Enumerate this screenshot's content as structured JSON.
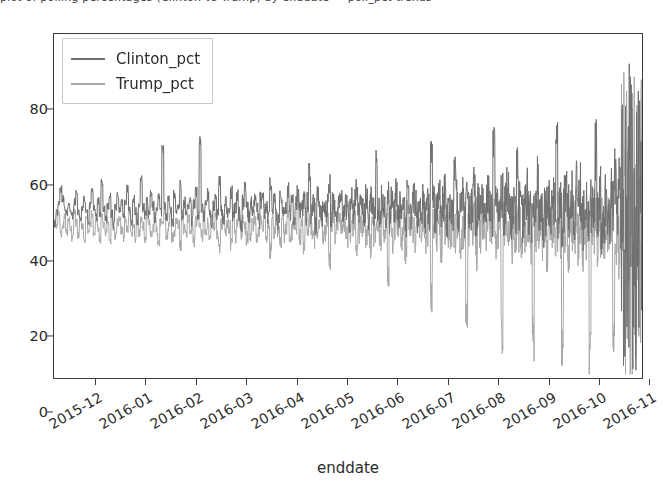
{
  "figure": {
    "top_text_fragment": "plot of polling percentages (Clinton vs Trump) by enddate — poll_pct trends",
    "background_color": "#ffffff"
  },
  "chart_data": {
    "type": "line",
    "title": "",
    "xlabel": "enddate",
    "ylabel": "",
    "ylim": [
      0,
      92
    ],
    "yticks": [
      0,
      20,
      40,
      60,
      80
    ],
    "ytick_labels": [
      "0",
      "20",
      "40",
      "60",
      "80"
    ],
    "grid": false,
    "legend_position": "upper left",
    "xticks": [
      0,
      1,
      2,
      3,
      4,
      5,
      6,
      7,
      8,
      9,
      10,
      11
    ],
    "xtick_labels": [
      "2015-12",
      "2016-01",
      "2016-02",
      "2016-03",
      "2016-04",
      "2016-05",
      "2016-06",
      "2016-07",
      "2016-08",
      "2016-09",
      "2016-10",
      "2016-11"
    ],
    "x_range": [
      "2015-11-20",
      "2016-11-08"
    ],
    "series": [
      {
        "name": "Clinton_pct",
        "color": "#6f6f6f",
        "linewidth": 1.0,
        "mean_level": 44,
        "noise_profile": "increasing-variance",
        "values": [
          41.0,
          44.5,
          47.0,
          50.5,
          48.0,
          45.5,
          44.0,
          46.5,
          45.0,
          43.5,
          47.0,
          49.5,
          44.0,
          42.0,
          45.5,
          48.0,
          44.5,
          41.5,
          46.0,
          50.0,
          45.5,
          43.0,
          47.5,
          44.0,
          52.5,
          45.0,
          42.5,
          46.0,
          48.5,
          44.0,
          41.0,
          45.5,
          49.0,
          44.5,
          47.0,
          43.0,
          46.5,
          50.5,
          45.0,
          42.0,
          48.0,
          44.5,
          41.5,
          46.0,
          53.0,
          45.5,
          43.5,
          47.0,
          44.0,
          49.0,
          46.0,
          42.5,
          45.0,
          48.5,
          44.0,
          61.5,
          46.5,
          43.0,
          47.5,
          45.0,
          41.0,
          49.5,
          44.5,
          46.0,
          52.0,
          43.5,
          47.0,
          44.0,
          45.5,
          48.0,
          42.0,
          46.5,
          50.0,
          44.0,
          63.0,
          45.5,
          43.0,
          47.5,
          49.0,
          44.5,
          41.5,
          46.0,
          48.0,
          44.0,
          52.5,
          45.0,
          42.5,
          47.0,
          44.5,
          46.0,
          49.5,
          43.0,
          45.5,
          48.5,
          44.0,
          41.0,
          47.0,
          50.5,
          45.0,
          43.5,
          46.5,
          44.0,
          48.0,
          45.5,
          42.0,
          47.5,
          49.0,
          44.5,
          46.0,
          43.0,
          52.0,
          45.0,
          47.5,
          44.0,
          41.5,
          48.5,
          46.0,
          43.5,
          45.5,
          50.0,
          44.0,
          47.0,
          42.5,
          46.5,
          49.5,
          44.5,
          45.0,
          48.0,
          43.0,
          47.0,
          55.0,
          44.0,
          46.5,
          41.0,
          49.0,
          45.5,
          43.5,
          47.5,
          44.5,
          46.0,
          52.0,
          42.0,
          48.0,
          45.0,
          44.0,
          47.5,
          49.5,
          43.0,
          46.0,
          45.5,
          41.5,
          48.5,
          44.5,
          47.0,
          51.0,
          43.5,
          46.5,
          45.0,
          44.0,
          49.0,
          42.5,
          47.5,
          46.0,
          44.5,
          58.0,
          45.5,
          43.0,
          48.0,
          46.5,
          44.0,
          50.5,
          42.0,
          47.0,
          45.0,
          49.5,
          43.5,
          46.0,
          44.5,
          47.5,
          41.0,
          52.5,
          45.5,
          44.0,
          48.5,
          46.5,
          43.0,
          47.0,
          45.0,
          49.0,
          42.5,
          46.0,
          44.5,
          60.0,
          47.5,
          43.5,
          45.5,
          48.0,
          44.0,
          46.5,
          50.0,
          41.5,
          47.0,
          45.0,
          43.0,
          56.5,
          48.5,
          44.5,
          46.0,
          49.5,
          42.0,
          47.5,
          45.5,
          44.0,
          46.5,
          51.5,
          43.5,
          48.0,
          45.0,
          47.0,
          41.0,
          46.0,
          49.0,
          44.5,
          43.0,
          62.0,
          45.5,
          47.5,
          44.0,
          48.5,
          42.5,
          46.5,
          50.5,
          45.0,
          43.5,
          47.0,
          44.5,
          57.0,
          46.0,
          48.0,
          41.5,
          45.5,
          49.5,
          44.0,
          43.0,
          47.5,
          46.5,
          52.0,
          45.0,
          48.5,
          42.0,
          44.5,
          47.0,
          46.0,
          43.5,
          49.0,
          45.5,
          64.5,
          44.0,
          48.0,
          41.0,
          46.5,
          50.0,
          45.0,
          43.0,
          47.5,
          44.5,
          53.5,
          46.0,
          49.5,
          42.5,
          45.5,
          48.0,
          44.0,
          47.0,
          43.5,
          46.5,
          60.5,
          45.0,
          49.0,
          41.5,
          44.5,
          47.5,
          46.0,
          43.0,
          48.5,
          45.5,
          55.0,
          44.0,
          50.0,
          42.0,
          46.5,
          47.0,
          45.0,
          43.5,
          49.5,
          44.5,
          66.0,
          46.0,
          48.0,
          41.0
        ]
      },
      {
        "name": "Trump_pct",
        "color": "#a8a8a8",
        "linewidth": 1.0,
        "mean_level": 40,
        "noise_profile": "increasing-variance",
        "values": [
          42.0,
          40.5,
          44.0,
          38.5,
          41.0,
          43.5,
          39.0,
          42.5,
          40.0,
          37.5,
          44.5,
          41.5,
          38.0,
          42.0,
          40.5,
          36.5,
          43.0,
          39.5,
          41.0,
          44.0,
          38.5,
          42.5,
          40.0,
          37.0,
          43.5,
          41.0,
          39.0,
          42.0,
          36.0,
          44.5,
          40.5,
          38.0,
          41.5,
          43.0,
          39.5,
          37.5,
          42.5,
          40.0,
          44.0,
          38.5,
          41.0,
          36.5,
          43.5,
          39.0,
          42.0,
          40.5,
          37.0,
          44.5,
          41.5,
          38.5,
          40.0,
          43.0,
          39.5,
          36.0,
          42.0,
          41.0,
          44.0,
          38.0,
          40.5,
          43.5,
          37.5,
          39.0,
          42.5,
          41.5,
          35.5,
          44.0,
          40.0,
          38.5,
          43.0,
          39.5,
          41.0,
          36.5,
          42.0,
          44.5,
          40.5,
          38.0,
          43.5,
          39.0,
          41.5,
          37.0,
          42.5,
          40.0,
          44.0,
          38.5,
          35.0,
          41.0,
          43.0,
          39.5,
          42.0,
          40.5,
          36.0,
          44.5,
          38.0,
          41.5,
          43.5,
          39.0,
          42.5,
          40.0,
          37.5,
          44.0,
          38.5,
          41.0,
          43.0,
          36.5,
          39.5,
          42.0,
          40.5,
          44.5,
          38.0,
          41.5,
          34.0,
          43.5,
          39.0,
          42.5,
          40.0,
          37.0,
          44.0,
          38.5,
          41.0,
          43.0,
          36.0,
          39.5,
          42.0,
          40.5,
          44.5,
          38.0,
          41.5,
          35.5,
          43.5,
          39.0,
          42.5,
          40.0,
          37.5,
          44.0,
          38.5,
          41.0,
          43.0,
          36.5,
          39.5,
          42.0,
          30.5,
          40.5,
          44.5,
          38.0,
          41.5,
          43.5,
          39.0,
          42.5,
          40.0,
          37.0,
          44.0,
          38.5,
          41.0,
          43.0,
          36.0,
          39.5,
          42.0,
          40.5,
          44.5,
          38.0,
          41.5,
          35.0,
          43.5,
          39.0,
          42.5,
          40.0,
          37.5,
          44.0,
          38.5,
          41.0,
          28.0,
          43.0,
          36.5,
          39.5,
          42.0,
          40.5,
          44.5,
          38.0,
          41.5,
          34.5,
          43.5,
          39.0,
          42.5,
          40.0,
          37.0,
          44.0,
          38.5,
          41.0,
          43.0,
          36.0,
          39.5,
          42.0,
          22.5,
          40.5,
          44.5,
          38.0,
          41.5,
          35.5,
          43.5,
          39.0,
          42.5,
          40.0,
          37.5,
          44.0,
          38.5,
          41.0,
          43.0,
          36.5,
          39.5,
          42.0,
          17.0,
          40.5,
          44.5,
          38.0,
          41.5,
          34.0,
          43.5,
          39.0,
          42.5,
          40.0,
          37.0,
          44.0,
          38.5,
          41.0,
          43.0,
          36.0,
          39.5,
          42.0,
          12.5,
          40.5,
          44.5,
          38.0,
          41.5,
          35.0,
          43.5,
          39.0,
          42.5,
          40.0,
          37.5,
          44.0,
          38.5,
          41.0,
          43.0,
          36.5,
          10.0,
          39.5,
          42.0,
          40.5,
          44.5,
          38.0,
          41.5,
          34.5,
          43.5,
          39.0,
          42.5,
          40.0,
          37.0,
          44.0,
          38.5,
          9.0,
          41.0,
          43.0,
          36.0,
          39.5,
          42.0,
          40.5,
          44.5,
          38.0,
          41.5,
          35.5,
          43.5,
          39.0,
          42.5,
          7.5,
          40.0,
          37.5,
          44.0,
          38.5,
          41.0,
          43.0,
          36.5,
          39.5,
          42.0,
          40.5,
          44.5,
          6.0,
          38.0,
          41.5,
          34.0,
          43.5,
          39.0,
          42.5,
          40.0,
          37.0,
          44.0,
          38.5,
          41.0,
          43.0,
          5.0,
          36.0
        ]
      }
    ],
    "annotations": [
      {
        "text": "dense vertical band of polls near election day",
        "x_region": "2016-11"
      }
    ]
  },
  "legend": {
    "entries": [
      {
        "label": "Clinton_pct",
        "color": "#6f6f6f"
      },
      {
        "label": "Trump_pct",
        "color": "#a8a8a8"
      }
    ]
  },
  "axis": {
    "xlabel": "enddate",
    "ytick_labels": [
      "0",
      "20",
      "40",
      "60",
      "80"
    ],
    "xtick_labels": [
      "2015-12",
      "2016-01",
      "2016-02",
      "2016-03",
      "2016-04",
      "2016-05",
      "2016-06",
      "2016-07",
      "2016-08",
      "2016-09",
      "2016-10",
      "2016-11"
    ]
  }
}
